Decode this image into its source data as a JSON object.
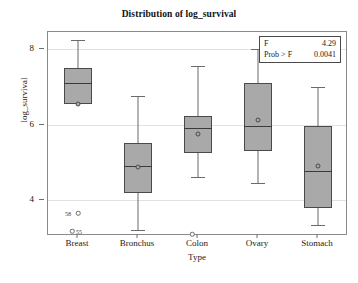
{
  "chart_data": {
    "type": "box",
    "title": "Distribution of log_survival",
    "xlabel": "Type",
    "ylabel": "log_survival",
    "categories": [
      "Breast",
      "Bronchus",
      "Colon",
      "Ovary",
      "Stomach"
    ],
    "ylim": [
      3.05,
      8.45
    ],
    "yticks": [
      4,
      6,
      8
    ],
    "ytick_labels": [
      "4",
      "6",
      "8"
    ],
    "grid": true,
    "legend_position": "top-right",
    "boxes": [
      {
        "category": "Breast",
        "whisker_low": 6.55,
        "q1": 6.55,
        "median": 7.1,
        "q3": 7.5,
        "whisker_high": 8.25,
        "mean": 6.55,
        "outliers": [
          {
            "value": 3.65,
            "label": "58",
            "label_side": "left"
          },
          {
            "value": 3.18,
            "label": "55",
            "label_side": "right"
          }
        ]
      },
      {
        "category": "Bronchus",
        "whisker_low": 3.2,
        "q1": 4.2,
        "median": 4.9,
        "q3": 5.5,
        "whisker_high": 6.75,
        "mean": 4.88,
        "outliers": []
      },
      {
        "category": "Colon",
        "whisker_low": 4.6,
        "q1": 5.25,
        "median": 5.9,
        "q3": 6.22,
        "whisker_high": 7.55,
        "mean": 5.75,
        "outliers": [
          {
            "value": 3.1,
            "label": "",
            "label_side": "right"
          }
        ]
      },
      {
        "category": "Ovary",
        "whisker_low": 4.45,
        "q1": 5.3,
        "median": 5.95,
        "q3": 7.1,
        "whisker_high": 8.0,
        "mean": 6.12,
        "outliers": []
      },
      {
        "category": "Stomach",
        "whisker_low": 3.35,
        "q1": 3.8,
        "median": 4.78,
        "q3": 5.95,
        "whisker_high": 7.0,
        "mean": 4.9,
        "outliers": []
      }
    ],
    "annotations": {
      "f_label": "F",
      "f_value": "4.29",
      "prob_label": "Prob > F",
      "prob_value": "0.0041"
    },
    "colors": {
      "box_fill": "#a9a9a9",
      "box_edge": "#4a4a4a",
      "grid": "#e2e2e2",
      "frame": "#8a8a8a",
      "text": "#1a1a1a"
    }
  }
}
